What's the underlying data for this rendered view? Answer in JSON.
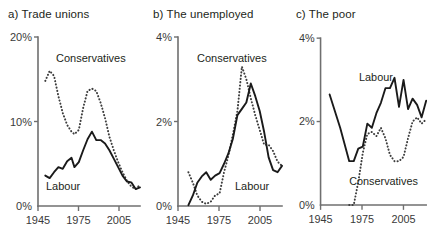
{
  "figure": {
    "width": 440,
    "height": 248,
    "background": "#ffffff",
    "ink_color": "#1a1a1a",
    "axis_color": "#6f6f6f"
  },
  "series_labels": {
    "labour": "Labour",
    "conservatives": "Conservatives"
  },
  "chart_data": [
    {
      "type": "line",
      "panel": "a",
      "title": "a) Trade unions",
      "xlabel": "",
      "ylabel": "",
      "xlim": [
        1945,
        2015
      ],
      "ylim": [
        0,
        20
      ],
      "grid": false,
      "legend": "inline-annotation",
      "xticks": [
        1945,
        1975,
        2005
      ],
      "xticklabels": [
        "1945",
        "1975",
        "2005"
      ],
      "yticks": [
        0,
        10,
        20
      ],
      "yticklabels": [
        "0%",
        "10%",
        "20%"
      ],
      "series": [
        {
          "name": "Labour",
          "style": "solid",
          "x": [
            1950,
            1953,
            1956,
            1959,
            1962,
            1965,
            1968,
            1970,
            1973,
            1976,
            1979,
            1982,
            1985,
            1988,
            1991,
            1994,
            1997,
            2000,
            2003,
            2006,
            2009,
            2012,
            2015
          ],
          "values": [
            3.6,
            3.3,
            4.0,
            4.6,
            4.4,
            5.3,
            5.7,
            4.6,
            5.2,
            6.6,
            7.9,
            8.8,
            7.8,
            7.8,
            7.4,
            6.6,
            5.6,
            4.6,
            3.6,
            2.9,
            2.8,
            2.0,
            2.2
          ]
        },
        {
          "name": "Conservatives",
          "style": "dotted",
          "x": [
            1950,
            1953,
            1956,
            1959,
            1962,
            1965,
            1968,
            1970,
            1973,
            1976,
            1979,
            1982,
            1985,
            1988,
            1991,
            1994,
            1997,
            2000,
            2003,
            2006,
            2009,
            2012,
            2015
          ],
          "values": [
            14.8,
            16.0,
            15.4,
            13.0,
            11.0,
            9.6,
            8.8,
            8.5,
            9.0,
            11.6,
            13.6,
            13.9,
            13.6,
            12.2,
            10.4,
            8.2,
            6.6,
            5.2,
            4.0,
            3.0,
            2.3,
            2.0,
            2.5
          ]
        }
      ],
      "annotations": [
        {
          "text": "Conservatives",
          "x": 1963,
          "y": 16.8
        },
        {
          "text": "Labour",
          "x": 1960,
          "y": 2.6
        }
      ]
    },
    {
      "type": "line",
      "panel": "b",
      "title": "b) The unemployed",
      "xlabel": "",
      "ylabel": "",
      "xlim": [
        1945,
        2015
      ],
      "ylim": [
        0,
        4
      ],
      "grid": false,
      "legend": "inline-annotation",
      "xticks": [
        1945,
        1975,
        2005
      ],
      "xticklabels": [
        "1945",
        "1975",
        "2005"
      ],
      "yticks": [
        0,
        2,
        4
      ],
      "yticklabels": [
        "0%",
        "2%",
        "4%"
      ],
      "series": [
        {
          "name": "Labour",
          "style": "solid",
          "x": [
            1952,
            1955,
            1958,
            1961,
            1964,
            1967,
            1970,
            1973,
            1976,
            1979,
            1982,
            1985,
            1988,
            1991,
            1994,
            1997,
            2000,
            2003,
            2006,
            2009,
            2012,
            2015
          ],
          "values": [
            0.02,
            0.25,
            0.55,
            0.7,
            0.8,
            0.62,
            0.72,
            0.78,
            1.0,
            1.25,
            1.6,
            2.15,
            2.3,
            2.45,
            2.9,
            2.6,
            2.25,
            1.75,
            1.15,
            0.85,
            0.8,
            0.95
          ]
        },
        {
          "name": "Conservatives",
          "style": "dotted",
          "x": [
            1952,
            1955,
            1958,
            1961,
            1964,
            1967,
            1970,
            1973,
            1976,
            1979,
            1982,
            1985,
            1988,
            1991,
            1994,
            1997,
            2000,
            2003,
            2006,
            2009,
            2012,
            2015
          ],
          "values": [
            0.8,
            0.55,
            0.25,
            0.1,
            0.05,
            0.1,
            0.25,
            0.3,
            0.8,
            1.2,
            1.7,
            2.25,
            3.3,
            3.0,
            2.55,
            2.15,
            1.8,
            1.45,
            1.45,
            1.3,
            1.05,
            0.95
          ]
        }
      ],
      "annotations": [
        {
          "text": "Conservatives",
          "x": 1989,
          "y": 3.6
        },
        {
          "text": "Labour",
          "x": 2002,
          "y": 0.62
        }
      ]
    },
    {
      "type": "line",
      "panel": "c",
      "title": "c) The poor",
      "xlabel": "",
      "ylabel": "",
      "xlim": [
        1945,
        2015
      ],
      "ylim": [
        0,
        4
      ],
      "grid": false,
      "legend": "inline-annotation",
      "xticks": [
        1945,
        1975,
        2005
      ],
      "xticklabels": [
        "1945",
        "1975",
        "2005"
      ],
      "yticks": [
        0,
        2,
        4
      ],
      "yticklabels": [
        "0%",
        "2%",
        "4%"
      ],
      "series": [
        {
          "name": "Labour",
          "style": "solid",
          "x": [
            1951,
            1958,
            1964,
            1967,
            1970,
            1973,
            1976,
            1979,
            1982,
            1985,
            1988,
            1991,
            1994,
            1997,
            2000,
            2003,
            2006,
            2009,
            2012,
            2015
          ],
          "values": [
            2.65,
            1.85,
            1.05,
            1.05,
            1.35,
            1.4,
            1.95,
            1.85,
            2.2,
            2.45,
            2.8,
            2.8,
            3.05,
            2.35,
            3.0,
            2.3,
            2.55,
            2.4,
            2.1,
            2.5
          ]
        },
        {
          "name": "Conservatives",
          "style": "dotted",
          "x": [
            1964,
            1967,
            1970,
            1973,
            1976,
            1979,
            1982,
            1985,
            1988,
            1991,
            1994,
            1997,
            2000,
            2003,
            2006,
            2009,
            2012,
            2015
          ],
          "values": [
            0.0,
            0.0,
            0.55,
            1.25,
            1.7,
            1.75,
            1.65,
            1.85,
            1.6,
            1.2,
            1.05,
            1.05,
            1.15,
            1.6,
            2.0,
            2.1,
            1.95,
            2.05
          ]
        }
      ],
      "annotations": [
        {
          "text": "Labour",
          "x": 1992,
          "y": 3.42
        },
        {
          "text": "Conservatives",
          "x": 1999,
          "y": 0.72
        }
      ]
    }
  ]
}
